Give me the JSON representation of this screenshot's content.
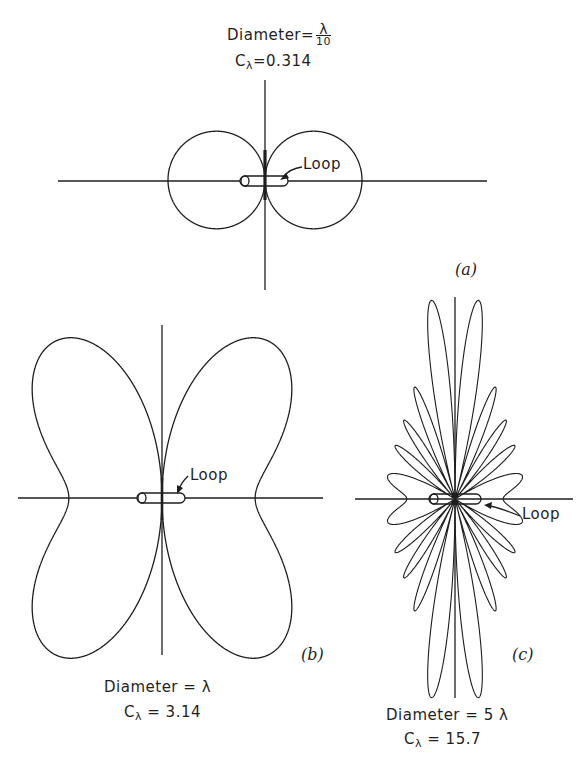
{
  "figure": {
    "panels": [
      {
        "id": "a",
        "panel_label": "(a)",
        "diameter_label": "Diameter",
        "equals": "=",
        "diameter_value_num": "λ",
        "diameter_value_den": "10",
        "c_symbol": "C",
        "c_subscript": "λ",
        "c_value": "0.314",
        "loop_label": "Loop"
      },
      {
        "id": "b",
        "panel_label": "(b)",
        "diameter_label": "Diameter",
        "equals": "=",
        "diameter_value": "λ",
        "c_symbol": "C",
        "c_subscript": "λ",
        "c_value": "3.14",
        "loop_label": "Loop"
      },
      {
        "id": "c",
        "panel_label": "(c)",
        "diameter_label": "Diameter",
        "equals": "=",
        "diameter_value": "5 λ",
        "c_symbol": "C",
        "c_subscript": "λ",
        "c_value": "15.7",
        "loop_label": "Loop"
      }
    ]
  },
  "chart_data": [
    {
      "type": "polar",
      "title": "Diameter = λ/10, Cλ = 0.314",
      "panel": "(a)",
      "circumference_wavelengths": 0.314,
      "pattern": "|J1(Cλ sinθ)| (small loop → sinθ, two circles)",
      "center_px": [
        265,
        180
      ],
      "max_radius_px": 97,
      "annotation": "Loop"
    },
    {
      "type": "polar",
      "title": "Diameter = λ, Cλ = 3.14",
      "panel": "(b)",
      "circumference_wavelengths": 3.14,
      "pattern": "|J1(Cλ sinθ)|",
      "center_px": [
        162,
        498
      ],
      "max_radius_px": 190,
      "annotation": "Loop"
    },
    {
      "type": "polar",
      "title": "Diameter = 5λ, Cλ = 15.7",
      "panel": "(c)",
      "circumference_wavelengths": 15.7,
      "pattern": "|J1(Cλ sinθ)|",
      "center_px": [
        455,
        499
      ],
      "max_radius_px": 200,
      "annotation": "Loop"
    }
  ]
}
